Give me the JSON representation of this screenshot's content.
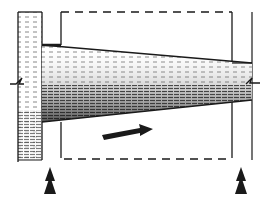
{
  "diagram": {
    "type": "structural-sketch",
    "subject": "tapered beam projecting from a hatched wall between two supports",
    "colors": {
      "ink": "#1a1a1a",
      "paper": "#ffffff",
      "hatch_light": "#6a6a6a",
      "hatch_dark": "#222222"
    },
    "elements": {
      "wall": {
        "label": "wall",
        "x": 18,
        "y": 12,
        "width": 24,
        "height": 148
      },
      "beam": {
        "label": "tapered beam",
        "left_top": 45,
        "left_bottom": 122,
        "right_top": 63,
        "right_bottom": 100
      },
      "dashed_outline": {
        "label": "outline",
        "left": 61,
        "right": 232,
        "top": 12,
        "bottom": 159
      },
      "right_line": {
        "label": "right boundary",
        "x": 252
      },
      "direction_arrow": {
        "label": "direction arrow",
        "from": [
          102,
          130
        ],
        "to": [
          152,
          128
        ]
      },
      "supports": [
        {
          "label": "left support arrow",
          "x": 50
        },
        {
          "label": "right support arrow",
          "x": 241
        }
      ],
      "break_marks": [
        {
          "label": "left break mark",
          "y": 82
        },
        {
          "label": "right break mark",
          "y": 83
        }
      ]
    }
  }
}
